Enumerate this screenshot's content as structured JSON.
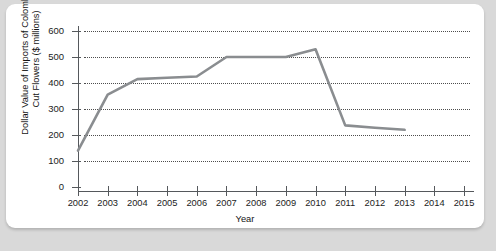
{
  "figure": {
    "background_color": "#d9d9d9",
    "card_color": "#ffffff",
    "line_color": "#8a8d90",
    "axis_color": "#55585c"
  },
  "chart_data": {
    "type": "line",
    "title": "",
    "xlabel": "Year",
    "ylabel": "Dollar Value of Imports of Colombian Cut Flowers ($ millions)",
    "ylabel_line1": "Dollar Value of Imports of Colombian",
    "ylabel_line2": "Cut Flowers ($ millions)",
    "x": [
      2002,
      2003,
      2004,
      2005,
      2006,
      2007,
      2008,
      2009,
      2010,
      2011,
      2012,
      2013
    ],
    "values": [
      140,
      355,
      415,
      420,
      425,
      500,
      500,
      500,
      530,
      237,
      228,
      220
    ],
    "xticklabels": [
      "2002",
      "2003",
      "2004",
      "2005",
      "2006",
      "2007",
      "2008",
      "2009",
      "2010",
      "2011",
      "2012",
      "2013",
      "2014",
      "2015"
    ],
    "xticks": [
      2002,
      2003,
      2004,
      2005,
      2006,
      2007,
      2008,
      2009,
      2010,
      2011,
      2012,
      2013,
      2014,
      2015
    ],
    "yticklabels": [
      "0",
      "100",
      "200",
      "300",
      "400",
      "500",
      "600"
    ],
    "yticks": [
      0,
      100,
      200,
      300,
      400,
      500,
      600
    ],
    "xlim": [
      2002,
      2015
    ],
    "ylim": [
      0,
      600
    ],
    "grid": "horizontal-dotted",
    "legend": "none",
    "series_name": "Dollar Value of Imports of Colombian Cut Flowers"
  }
}
